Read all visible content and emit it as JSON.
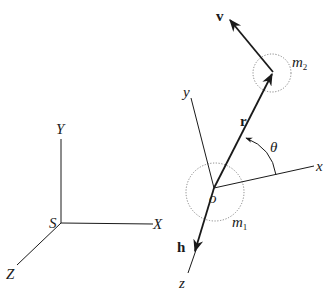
{
  "diagram": {
    "type": "two-body reference frames",
    "inertial_frame": {
      "origin_label": "S",
      "axes": {
        "x": "X",
        "y": "Y",
        "z": "Z"
      }
    },
    "body_frame": {
      "origin_label": "o",
      "axes": {
        "x": "x",
        "y": "y",
        "z": "z"
      }
    },
    "masses": {
      "m1": {
        "base": "m",
        "sub": "1"
      },
      "m2": {
        "base": "m",
        "sub": "2"
      }
    },
    "vectors": {
      "position": "r",
      "velocity": "v",
      "angular_momentum": "h"
    },
    "angle_label": "θ",
    "colors": {
      "line": "#1a1a1a",
      "circle": "#777777",
      "background": "#ffffff"
    }
  }
}
